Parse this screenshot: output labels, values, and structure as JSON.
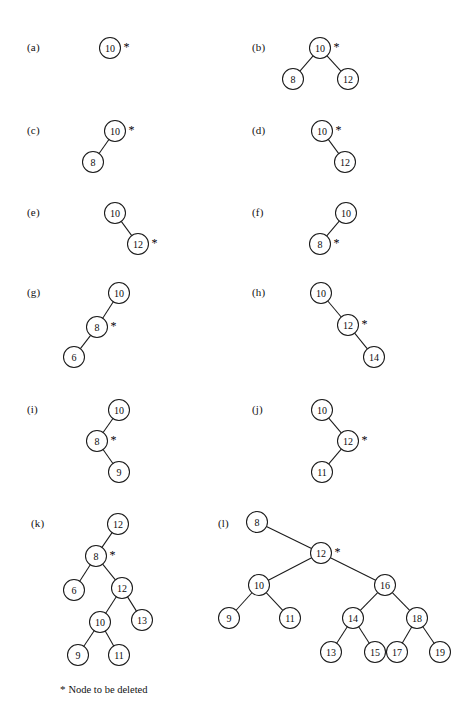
{
  "figure": {
    "width": 475,
    "height": 705,
    "background": "#ffffff",
    "stroke_color": "#1a1a1a",
    "text_color": "#0d0d0d",
    "node_radius": 10.5,
    "caption": {
      "star": "*",
      "text": "Node to be deleted"
    }
  },
  "panels": [
    {
      "id": "a",
      "label": "(a)",
      "label_x": 27,
      "label_y": 48,
      "nodes": [
        {
          "id": "n0",
          "value": "10",
          "x": 110,
          "y": 48,
          "starred": true
        }
      ],
      "edges": []
    },
    {
      "id": "b",
      "label": "(b)",
      "label_x": 252,
      "label_y": 48,
      "nodes": [
        {
          "id": "n0",
          "value": "10",
          "x": 320,
          "y": 48,
          "starred": true
        },
        {
          "id": "n1",
          "value": "8",
          "x": 293,
          "y": 79,
          "starred": false
        },
        {
          "id": "n2",
          "value": "12",
          "x": 348,
          "y": 79,
          "starred": false
        }
      ],
      "edges": [
        {
          "from": "n0",
          "to": "n1"
        },
        {
          "from": "n0",
          "to": "n2"
        }
      ]
    },
    {
      "id": "c",
      "label": "(c)",
      "label_x": 27,
      "label_y": 131,
      "nodes": [
        {
          "id": "n0",
          "value": "10",
          "x": 115,
          "y": 131,
          "starred": true
        },
        {
          "id": "n1",
          "value": "8",
          "x": 93,
          "y": 162,
          "starred": false
        }
      ],
      "edges": [
        {
          "from": "n0",
          "to": "n1"
        }
      ]
    },
    {
      "id": "d",
      "label": "(d)",
      "label_x": 252,
      "label_y": 131,
      "nodes": [
        {
          "id": "n0",
          "value": "10",
          "x": 322,
          "y": 131,
          "starred": true
        },
        {
          "id": "n1",
          "value": "12",
          "x": 345,
          "y": 162,
          "starred": false
        }
      ],
      "edges": [
        {
          "from": "n0",
          "to": "n1"
        }
      ]
    },
    {
      "id": "e",
      "label": "(e)",
      "label_x": 27,
      "label_y": 213,
      "nodes": [
        {
          "id": "n0",
          "value": "10",
          "x": 115,
          "y": 213,
          "starred": false
        },
        {
          "id": "n1",
          "value": "12",
          "x": 138,
          "y": 244,
          "starred": true
        }
      ],
      "edges": [
        {
          "from": "n0",
          "to": "n1"
        }
      ]
    },
    {
      "id": "f",
      "label": "(f)",
      "label_x": 252,
      "label_y": 213,
      "nodes": [
        {
          "id": "n0",
          "value": "10",
          "x": 346,
          "y": 213,
          "starred": false
        },
        {
          "id": "n1",
          "value": "8",
          "x": 320,
          "y": 244,
          "starred": true
        }
      ],
      "edges": [
        {
          "from": "n0",
          "to": "n1"
        }
      ]
    },
    {
      "id": "g",
      "label": "(g)",
      "label_x": 27,
      "label_y": 293,
      "nodes": [
        {
          "id": "n0",
          "value": "10",
          "x": 119,
          "y": 293,
          "starred": false
        },
        {
          "id": "n1",
          "value": "8",
          "x": 97,
          "y": 327,
          "starred": true
        },
        {
          "id": "n2",
          "value": "6",
          "x": 74,
          "y": 357,
          "starred": false
        }
      ],
      "edges": [
        {
          "from": "n0",
          "to": "n1"
        },
        {
          "from": "n1",
          "to": "n2"
        }
      ]
    },
    {
      "id": "h",
      "label": "(h)",
      "label_x": 252,
      "label_y": 293,
      "nodes": [
        {
          "id": "n0",
          "value": "10",
          "x": 321,
          "y": 293,
          "starred": false
        },
        {
          "id": "n1",
          "value": "12",
          "x": 348,
          "y": 325,
          "starred": true
        },
        {
          "id": "n2",
          "value": "14",
          "x": 374,
          "y": 357,
          "starred": false
        }
      ],
      "edges": [
        {
          "from": "n0",
          "to": "n1"
        },
        {
          "from": "n1",
          "to": "n2"
        }
      ]
    },
    {
      "id": "i",
      "label": "(i)",
      "label_x": 27,
      "label_y": 410,
      "nodes": [
        {
          "id": "n0",
          "value": "10",
          "x": 119,
          "y": 410,
          "starred": false
        },
        {
          "id": "n1",
          "value": "8",
          "x": 97,
          "y": 441,
          "starred": true
        },
        {
          "id": "n2",
          "value": "9",
          "x": 119,
          "y": 472,
          "starred": false
        }
      ],
      "edges": [
        {
          "from": "n0",
          "to": "n1"
        },
        {
          "from": "n1",
          "to": "n2"
        }
      ]
    },
    {
      "id": "j",
      "label": "(j)",
      "label_x": 252,
      "label_y": 410,
      "nodes": [
        {
          "id": "n0",
          "value": "10",
          "x": 322,
          "y": 410,
          "starred": false
        },
        {
          "id": "n1",
          "value": "12",
          "x": 348,
          "y": 441,
          "starred": true
        },
        {
          "id": "n2",
          "value": "11",
          "x": 322,
          "y": 472,
          "starred": false
        }
      ],
      "edges": [
        {
          "from": "n0",
          "to": "n1"
        },
        {
          "from": "n1",
          "to": "n2"
        }
      ]
    },
    {
      "id": "k",
      "label": "(k)",
      "label_x": 31,
      "label_y": 524,
      "nodes": [
        {
          "id": "n0",
          "value": "12",
          "x": 118,
          "y": 524,
          "starred": false
        },
        {
          "id": "n1",
          "value": "8",
          "x": 96,
          "y": 556,
          "starred": true
        },
        {
          "id": "n2",
          "value": "6",
          "x": 74,
          "y": 590,
          "starred": false
        },
        {
          "id": "n3",
          "value": "12",
          "x": 122,
          "y": 588,
          "starred": false
        },
        {
          "id": "n4",
          "value": "10",
          "x": 100,
          "y": 622,
          "starred": false
        },
        {
          "id": "n5",
          "value": "13",
          "x": 142,
          "y": 620,
          "starred": false
        },
        {
          "id": "n6",
          "value": "9",
          "x": 78,
          "y": 655,
          "starred": false
        },
        {
          "id": "n7",
          "value": "11",
          "x": 119,
          "y": 655,
          "starred": false
        }
      ],
      "edges": [
        {
          "from": "n0",
          "to": "n1"
        },
        {
          "from": "n1",
          "to": "n2"
        },
        {
          "from": "n1",
          "to": "n3"
        },
        {
          "from": "n3",
          "to": "n4"
        },
        {
          "from": "n3",
          "to": "n5"
        },
        {
          "from": "n4",
          "to": "n6"
        },
        {
          "from": "n4",
          "to": "n7"
        }
      ]
    },
    {
      "id": "l",
      "label": "(l)",
      "label_x": 218,
      "label_y": 524,
      "nodes": [
        {
          "id": "n0",
          "value": "8",
          "x": 257,
          "y": 522,
          "starred": false
        },
        {
          "id": "n1",
          "value": "12",
          "x": 321,
          "y": 553,
          "starred": true
        },
        {
          "id": "n2",
          "value": "10",
          "x": 259,
          "y": 585,
          "starred": false
        },
        {
          "id": "n3",
          "value": "16",
          "x": 385,
          "y": 585,
          "starred": false
        },
        {
          "id": "n4",
          "value": "9",
          "x": 229,
          "y": 618,
          "starred": false
        },
        {
          "id": "n5",
          "value": "11",
          "x": 290,
          "y": 618,
          "starred": false
        },
        {
          "id": "n6",
          "value": "14",
          "x": 353,
          "y": 618,
          "starred": false
        },
        {
          "id": "n7",
          "value": "18",
          "x": 417,
          "y": 618,
          "starred": false
        },
        {
          "id": "n8",
          "value": "13",
          "x": 331,
          "y": 652,
          "starred": false
        },
        {
          "id": "n9",
          "value": "15",
          "x": 375,
          "y": 652,
          "starred": false
        },
        {
          "id": "n10",
          "value": "17",
          "x": 397,
          "y": 652,
          "starred": false
        },
        {
          "id": "n11",
          "value": "19",
          "x": 440,
          "y": 652,
          "starred": false
        }
      ],
      "edges": [
        {
          "from": "n0",
          "to": "n1"
        },
        {
          "from": "n1",
          "to": "n2"
        },
        {
          "from": "n1",
          "to": "n3"
        },
        {
          "from": "n2",
          "to": "n4"
        },
        {
          "from": "n2",
          "to": "n5"
        },
        {
          "from": "n3",
          "to": "n6"
        },
        {
          "from": "n3",
          "to": "n7"
        },
        {
          "from": "n6",
          "to": "n8"
        },
        {
          "from": "n6",
          "to": "n9"
        },
        {
          "from": "n7",
          "to": "n10"
        },
        {
          "from": "n7",
          "to": "n11"
        }
      ]
    }
  ]
}
